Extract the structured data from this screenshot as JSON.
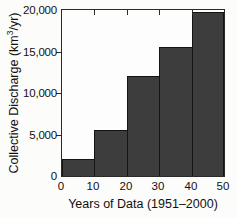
{
  "figure": {
    "background": "#fcfcfb",
    "plot_background": "#fdfdfd",
    "bar_fill": "#3d3d3d",
    "bar_edge": "#141414",
    "axis_color": "#2a2a2a",
    "text_color": "#111111"
  },
  "chart_data": {
    "type": "bar",
    "style": "histogram-contiguous-bars",
    "title": "",
    "xlabel": "Years of Data (1951–2000)",
    "ylabel": "Collective Discharge (km³/yr)",
    "ylabel_parts": {
      "pre": "Collective Discharge (km",
      "sup": "3",
      "post": "/yr)"
    },
    "categories": [
      "0–10",
      "10–20",
      "20–30",
      "30–40",
      "40–50"
    ],
    "values": [
      2000,
      5500,
      12000,
      15500,
      19700
    ],
    "xlim": [
      0,
      50
    ],
    "ylim": [
      0,
      20000
    ],
    "xticks": [
      0,
      10,
      20,
      30,
      40,
      50
    ],
    "xtick_labels": [
      "0",
      "10",
      "20",
      "30",
      "40",
      "50"
    ],
    "ytick_values": [
      0,
      5000,
      10000,
      15000,
      20000
    ],
    "ytick_labels": [
      "0",
      "5,000",
      "10,000",
      "15,000",
      "20,000"
    ],
    "grid": false,
    "legend": null
  }
}
